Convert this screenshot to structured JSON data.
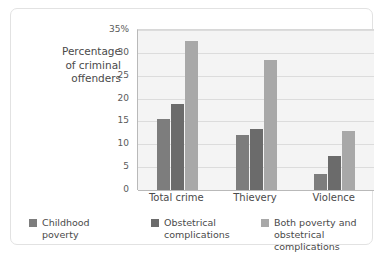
{
  "chart_data": {
    "type": "bar",
    "title": "",
    "subtitle": "",
    "xlabel": "",
    "ylabel": "Percentage\nof criminal\noffenders",
    "categories": [
      "Total crime",
      "Thievery",
      "Violence"
    ],
    "series": [
      {
        "name": "Childhood\npoverty",
        "values": [
          15.5,
          12.1,
          3.5
        ],
        "color": "#7d7d7d"
      },
      {
        "name": "Obstetrical\ncomplications",
        "values": [
          18.9,
          13.3,
          7.5
        ],
        "color": "#6b6b6b"
      },
      {
        "name": "Both poverty and\nobstetrical complications",
        "values": [
          32.5,
          28.4,
          12.9
        ],
        "color": "#a8a8a8"
      }
    ],
    "ylim": [
      0,
      35
    ],
    "ytick_labels": [
      "0",
      "5",
      "10",
      "15",
      "20",
      "25",
      "30",
      "35%"
    ],
    "ytick_values": [
      0,
      5,
      10,
      15,
      20,
      25,
      30,
      35
    ],
    "grid": true,
    "legend_position": "bottom",
    "plot_background": "#f4f4f4",
    "gridline_color": "#dcdcdc",
    "axis_color": "#b9b9b9"
  }
}
